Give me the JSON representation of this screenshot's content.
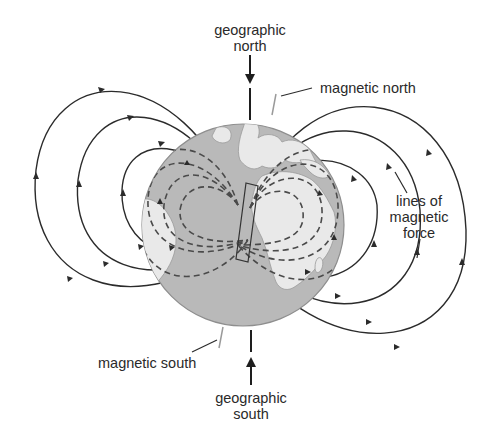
{
  "figure": {
    "labels": {
      "geographic_north": [
        "geographic",
        "north"
      ],
      "magnetic_north": "magnetic north",
      "lines_of_magnetic_force": [
        "lines of",
        "magnetic",
        "force"
      ],
      "magnetic_south": "magnetic south",
      "geographic_south": [
        "geographic",
        "south"
      ]
    },
    "globe": {
      "cx": 243,
      "cy": 225,
      "r": 101
    },
    "colors": {
      "ocean": "#b9b9b9",
      "land": "#e9e9e9",
      "line": "#2b2b2b",
      "dashed": "#4a4a4a",
      "leader": "#9a9a9a",
      "background": "#ffffff"
    },
    "field_lines": {
      "outer_solid_per_side": 3,
      "inner_dashed_per_side": 4,
      "arrow_direction": "south-to-north (outside globe)"
    }
  }
}
